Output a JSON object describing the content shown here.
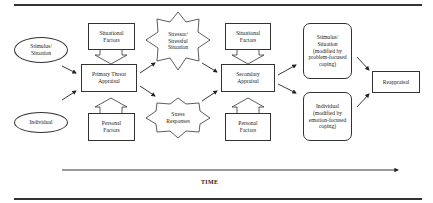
{
  "diagram": {
    "inputs": {
      "stimulus": "Stimulus/ Situation",
      "individual": "Individual"
    },
    "primary": {
      "situational_factors": "Situational Factors",
      "appraisal": "Primary Threat Appraisal",
      "personal_factors": "Personal Factors"
    },
    "middle": {
      "stressor": "Stressor/ Stressful Situation",
      "responses": "Stress Responses"
    },
    "secondary": {
      "situational_factors": "Situational Factors",
      "appraisal": "Secondary Appraisal",
      "personal_factors": "Personal Factors"
    },
    "coping": {
      "problem": "Stimulus/ Situation (modified by problem-focused coping)",
      "emotion": "Individual (modified by emotion-focused coping)"
    },
    "reappraisal": "Reappraisal",
    "time_axis": "TIME"
  },
  "colors": {
    "stroke": "#333333",
    "background": "#ffffff"
  }
}
